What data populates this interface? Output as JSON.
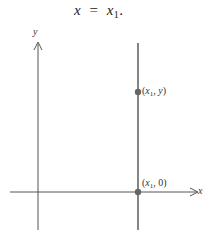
{
  "caption": {
    "lhs": "x",
    "equals": "=",
    "rhs_var": "x",
    "rhs_sub": "1",
    "end": "."
  },
  "axes": {
    "x_label": "x",
    "y_label": "y",
    "color": "#555555"
  },
  "vertical_line": {
    "label": "x = x1",
    "color": "#555555"
  },
  "points": [
    {
      "var": "x",
      "sub": "1",
      "sep": ",",
      "second": "y",
      "color": "#666666"
    },
    {
      "var": "x",
      "sub": "1",
      "sep": ",",
      "second": "0",
      "color": "#666666"
    }
  ]
}
